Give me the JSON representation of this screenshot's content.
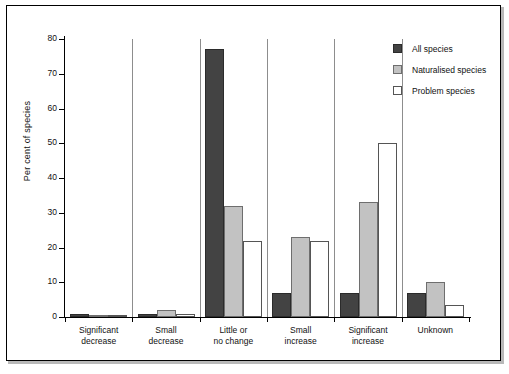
{
  "chart_data": {
    "type": "bar",
    "title": "",
    "xlabel": "",
    "ylabel": "Per cent of species",
    "ylim": [
      0,
      80
    ],
    "yticks": [
      0,
      10,
      20,
      30,
      40,
      50,
      60,
      70,
      80
    ],
    "grid": false,
    "legend_position": "top-right",
    "categories": [
      "Significant decrease",
      "Small decrease",
      "Little or no change",
      "Small increase",
      "Significant increase",
      "Unknown"
    ],
    "category_lines": [
      [
        "Significant",
        "decrease"
      ],
      [
        "Small",
        "decrease"
      ],
      [
        "Little or",
        "no change"
      ],
      [
        "Small",
        "increase"
      ],
      [
        "Significant",
        "increase"
      ],
      [
        "Unknown"
      ]
    ],
    "series": [
      {
        "name": "All species",
        "color": "#434343",
        "values": [
          1,
          1,
          77,
          7,
          7,
          7
        ]
      },
      {
        "name": "Naturalised species",
        "color": "#c2c2c2",
        "values": [
          0,
          2,
          32,
          23,
          33,
          10
        ]
      },
      {
        "name": "Problem species",
        "color": "#ffffff",
        "values": [
          0,
          0.5,
          22,
          22,
          50,
          3.5
        ]
      }
    ]
  },
  "legend": {
    "items": [
      {
        "label": "All species",
        "swatch": "s0"
      },
      {
        "label": "Naturalised species",
        "swatch": "s1"
      },
      {
        "label": "Problem species",
        "swatch": "s2"
      }
    ]
  },
  "axis": {
    "y_title": "Per cent of species",
    "y_tick_labels": [
      "80",
      "70",
      "60",
      "50",
      "40",
      "30",
      "20",
      "10",
      "0"
    ]
  }
}
